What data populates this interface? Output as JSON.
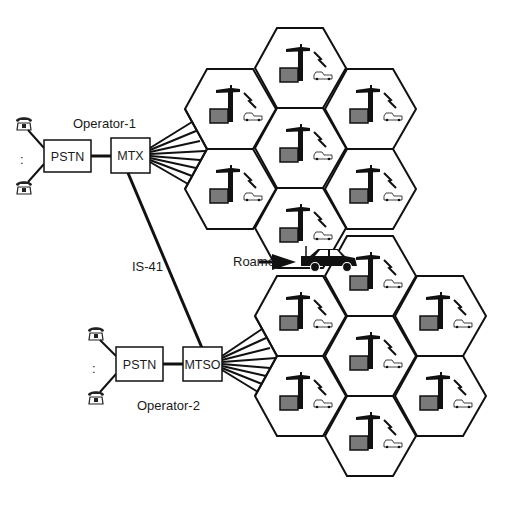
{
  "diagram": {
    "operator1": {
      "label": "Operator-1",
      "pstn_label": "PSTN",
      "switch_label": "MTX"
    },
    "operator2": {
      "label": "Operator-2",
      "pstn_label": "PSTN",
      "switch_label": "MTSO"
    },
    "intersystem_link": {
      "label": "IS-41"
    },
    "roamer": {
      "label": "Roamer"
    },
    "ellipsis": ":",
    "icons": [
      "telephone-icon",
      "base-station-tower-icon",
      "radio-link-icon",
      "mobile-car-icon",
      "roaming-car-icon",
      "arrow-icon"
    ],
    "clusters": [
      {
        "name": "operator-1-cluster",
        "cells": 7
      },
      {
        "name": "operator-2-cluster",
        "cells": 7
      }
    ],
    "colors": {
      "line": "#111111",
      "shelter_fill": "#7a7a7a",
      "background": "#ffffff"
    }
  }
}
